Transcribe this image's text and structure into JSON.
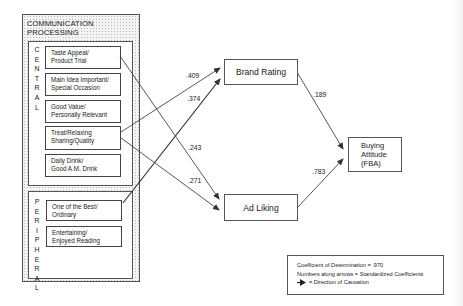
{
  "panel": {
    "title": "COMMUNICATION\nPROCESSING",
    "central": {
      "label": "C E N T R A L",
      "letters": [
        "C",
        "E",
        "N",
        "T",
        "R",
        "A",
        "L"
      ],
      "items": [
        "Taste Appeal/\nProduct Trial",
        "Main Idea Important/\nSpecial Occasion",
        "Good Value/\nPersonally Relevant",
        "Treat/Relaxing\nSharing/Quality",
        "Daily Drink/\nGood A.M. Drink"
      ]
    },
    "peripheral": {
      "label": "P E R I P H E R A L",
      "letters": [
        "P",
        "E",
        "R",
        "I",
        "P",
        "H",
        "E",
        "R",
        "A",
        "L"
      ],
      "items": [
        "One of the Best/\nOrdinary",
        "Entertaining/\nEnjoyed Reading"
      ]
    }
  },
  "nodes": {
    "brand_rating": "Brand Rating",
    "ad_liking": "Ad Liking",
    "buying_attitude": "Buying\nAttitude\n(FBA)"
  },
  "paths": [
    {
      "from": "Treat/Relaxing Sharing/Quality",
      "to": "Brand Rating",
      "coefficient": ".409"
    },
    {
      "from": "One of the Best/Ordinary",
      "to": "Brand Rating",
      "coefficient": ".374"
    },
    {
      "from": "Taste Appeal/Product Trial",
      "to": "Ad Liking",
      "coefficient": ".243"
    },
    {
      "from": "Treat/Relaxing Sharing/Quality",
      "to": "Ad Liking",
      "coefficient": ".271"
    },
    {
      "from": "Brand Rating",
      "to": "Buying Attitude (FBA)",
      "coefficient": ".189"
    },
    {
      "from": "Ad Liking",
      "to": "Buying Attitude (FBA)",
      "coefficient": ".783"
    }
  ],
  "legend": {
    "line1": "Coefficient of Determination  =  .970",
    "line2": "Numbers along arrows = Standardized Coefficients",
    "line3": "=  Direction of Causation"
  },
  "colors": {
    "line": "#444444",
    "border": "#555555",
    "panel_dots": "#b5b5b5",
    "background": "#ffffff"
  }
}
